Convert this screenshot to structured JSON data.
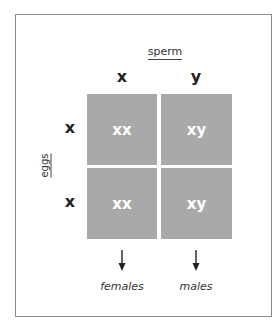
{
  "diagram": {
    "type": "punnett-square",
    "column_axis_label": "sperm",
    "row_axis_label": "eggs",
    "columns": [
      "x",
      "y"
    ],
    "rows": [
      "x",
      "x"
    ],
    "cells": [
      [
        "xx",
        "xy"
      ],
      [
        "xx",
        "xy"
      ]
    ],
    "outcomes": [
      "females",
      "males"
    ],
    "colors": {
      "cell_fill": "#a9a9a9",
      "cell_text": "#ffffff",
      "frame_border": "#8a8a8a"
    }
  }
}
